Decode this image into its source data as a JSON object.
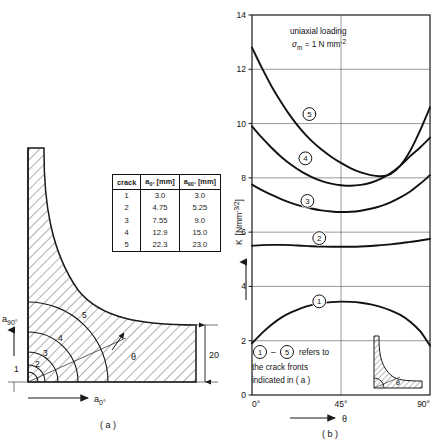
{
  "figure": {
    "panel_a_caption": "( a )",
    "panel_b_caption": "( b )"
  },
  "panel_a": {
    "axis_vertical_label": "a",
    "axis_vertical_sub": "90°",
    "axis_horizontal_label": "a",
    "axis_horizontal_sub": "0°",
    "angle_label": "θ",
    "thickness_dimension": "20",
    "crack_front_labels": [
      "1",
      "2",
      "3",
      "4",
      "5"
    ]
  },
  "table": {
    "headers": [
      "crack",
      "a₀° [mm]",
      "a₉₀° [mm]"
    ],
    "header_parts": [
      {
        "base": "crack",
        "sub": "",
        "unit": ""
      },
      {
        "base": "a",
        "sub": "0°",
        "unit": " [mm]"
      },
      {
        "base": "a",
        "sub": "90°",
        "unit": " [mm]"
      }
    ],
    "rows": [
      {
        "crack": "1",
        "a0": "3.0",
        "a90": "3.0"
      },
      {
        "crack": "2",
        "a0": "4.75",
        "a90": "5.25"
      },
      {
        "crack": "3",
        "a0": "7.55",
        "a90": "9.0"
      },
      {
        "crack": "4",
        "a0": "12.9",
        "a90": "15.0"
      },
      {
        "crack": "5",
        "a0": "22.3",
        "a90": "23.0"
      }
    ]
  },
  "chart_data": {
    "type": "line",
    "title": "",
    "annotation_line1": "uniaxial loading",
    "annotation_line2_base": "σ",
    "annotation_line2_sub": "m",
    "annotation_line2_rest": " = 1 N mm",
    "annotation_line2_sup": "-2",
    "xlabel": "θ",
    "ylabel_base": "K",
    "ylabel_unit": "[Nmm",
    "ylabel_unit_sup": "-3/2",
    "ylabel_unit_end": "]",
    "xlim": [
      0,
      90
    ],
    "ylim": [
      0,
      14
    ],
    "xticks": [
      0,
      45,
      90
    ],
    "xticklabels": [
      "0°",
      "45°",
      "90°"
    ],
    "yticks": [
      0,
      2,
      4,
      6,
      8,
      10,
      12,
      14
    ],
    "yticklabels": [
      "0",
      "2",
      "4",
      "6",
      "8",
      "10",
      "12",
      "14"
    ],
    "grid": true,
    "legend_position": "lower-left-inside",
    "legend_text_line1_a": "1",
    "legend_text_line1_b": "5",
    "legend_text_line1_dash": "–",
    "legend_text_line1_rest": "refers to",
    "legend_text_line2": "the crack fronts",
    "legend_text_line3": "indicated in ( a )",
    "legend_inset_angle_label": "θ",
    "series": [
      {
        "name": "1",
        "label_x": 34,
        "label_y": 3.45,
        "x": [
          0,
          5,
          10,
          15,
          20,
          25,
          30,
          35,
          40,
          45,
          50,
          55,
          60,
          65,
          70,
          75,
          80,
          85,
          90
        ],
        "y": [
          1.9,
          2.28,
          2.6,
          2.86,
          3.05,
          3.2,
          3.31,
          3.38,
          3.42,
          3.44,
          3.43,
          3.4,
          3.34,
          3.25,
          3.12,
          2.95,
          2.7,
          2.35,
          1.82
        ]
      },
      {
        "name": "2",
        "label_x": 34,
        "label_y": 5.78,
        "x": [
          0,
          5,
          10,
          15,
          20,
          25,
          30,
          35,
          40,
          45,
          50,
          55,
          60,
          65,
          70,
          75,
          80,
          85,
          90
        ],
        "y": [
          5.5,
          5.52,
          5.53,
          5.53,
          5.52,
          5.5,
          5.48,
          5.47,
          5.46,
          5.46,
          5.46,
          5.47,
          5.49,
          5.52,
          5.55,
          5.59,
          5.64,
          5.69,
          5.75
        ]
      },
      {
        "name": "3",
        "label_x": 28,
        "label_y": 7.15,
        "x": [
          0,
          5,
          10,
          15,
          20,
          25,
          30,
          35,
          40,
          45,
          50,
          55,
          60,
          65,
          70,
          75,
          80,
          85,
          90
        ],
        "y": [
          7.75,
          7.55,
          7.37,
          7.21,
          7.07,
          6.96,
          6.87,
          6.8,
          6.76,
          6.74,
          6.75,
          6.79,
          6.86,
          6.96,
          7.1,
          7.28,
          7.5,
          7.78,
          8.1
        ]
      },
      {
        "name": "4",
        "label_x": 27,
        "label_y": 8.72,
        "x": [
          0,
          5,
          10,
          15,
          20,
          25,
          30,
          35,
          40,
          45,
          50,
          55,
          60,
          65,
          70,
          75,
          80,
          85,
          90
        ],
        "y": [
          9.9,
          9.48,
          9.1,
          8.76,
          8.47,
          8.23,
          8.04,
          7.89,
          7.79,
          7.73,
          7.71,
          7.74,
          7.82,
          7.96,
          8.17,
          8.45,
          8.8,
          9.12,
          9.48
        ]
      },
      {
        "name": "5",
        "label_x": 29,
        "label_y": 10.35,
        "x": [
          0,
          5,
          10,
          15,
          20,
          25,
          30,
          35,
          40,
          45,
          50,
          55,
          60,
          65,
          70,
          75,
          80,
          85,
          90
        ],
        "y": [
          12.8,
          12.05,
          11.36,
          10.76,
          10.22,
          9.76,
          9.37,
          9.05,
          8.78,
          8.55,
          8.35,
          8.2,
          8.1,
          8.06,
          8.14,
          8.45,
          9.0,
          9.75,
          10.6
        ]
      }
    ]
  }
}
